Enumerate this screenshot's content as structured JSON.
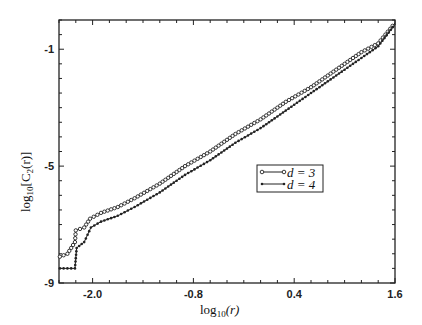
{
  "chart_data": {
    "type": "line",
    "title": "",
    "xlabel": "log10(r)",
    "ylabel": "log10[C2(r)]",
    "xlim": [
      -2.4,
      1.6
    ],
    "ylim": [
      -9,
      0
    ],
    "x_ticks": [
      -2.0,
      -0.8,
      0.4,
      1.6
    ],
    "x_tick_labels": [
      "-2.0",
      "-0.8",
      "0.4",
      "1.6"
    ],
    "y_ticks": [
      -1,
      -5,
      -9
    ],
    "y_tick_labels": [
      "-1",
      "-5",
      "-9"
    ],
    "grid": false,
    "legend_position": "center-right",
    "series": [
      {
        "name": "d = 3",
        "marker": "open-circle",
        "x": [
          -2.39,
          -2.3,
          -2.21,
          -2.2,
          -2.1,
          -2.03,
          -1.9,
          -1.7,
          -1.5,
          -1.2,
          -0.9,
          -0.6,
          -0.3,
          0.0,
          0.3,
          0.6,
          0.9,
          1.2,
          1.4,
          1.6
        ],
        "y": [
          -8.1,
          -8.0,
          -7.6,
          -7.2,
          -7.1,
          -6.8,
          -6.6,
          -6.4,
          -6.1,
          -5.6,
          -5.0,
          -4.5,
          -3.9,
          -3.4,
          -2.8,
          -2.3,
          -1.7,
          -1.1,
          -0.8,
          -0.1
        ]
      },
      {
        "name": "d = 4",
        "marker": "filled-dot",
        "x": [
          -2.39,
          -2.3,
          -2.21,
          -2.19,
          -2.1,
          -2.02,
          -1.9,
          -1.7,
          -1.5,
          -1.2,
          -0.9,
          -0.6,
          -0.3,
          0.0,
          0.3,
          0.6,
          0.9,
          1.2,
          1.4,
          1.6
        ],
        "y": [
          -8.5,
          -8.5,
          -8.5,
          -7.8,
          -7.6,
          -7.1,
          -6.9,
          -6.7,
          -6.4,
          -5.9,
          -5.3,
          -4.8,
          -4.2,
          -3.7,
          -3.1,
          -2.5,
          -1.9,
          -1.3,
          -0.9,
          -0.15
        ]
      }
    ]
  },
  "labels": {
    "xlabel_main": "log",
    "xlabel_sub": "10",
    "xlabel_arg": "(r)",
    "ylabel_main": "log",
    "ylabel_sub": "10",
    "ylabel_arg": "[C",
    "ylabel_sub2": "2",
    "ylabel_tail": "(r)]",
    "legend_d3": "d = 3",
    "legend_d4": "d = 4"
  }
}
